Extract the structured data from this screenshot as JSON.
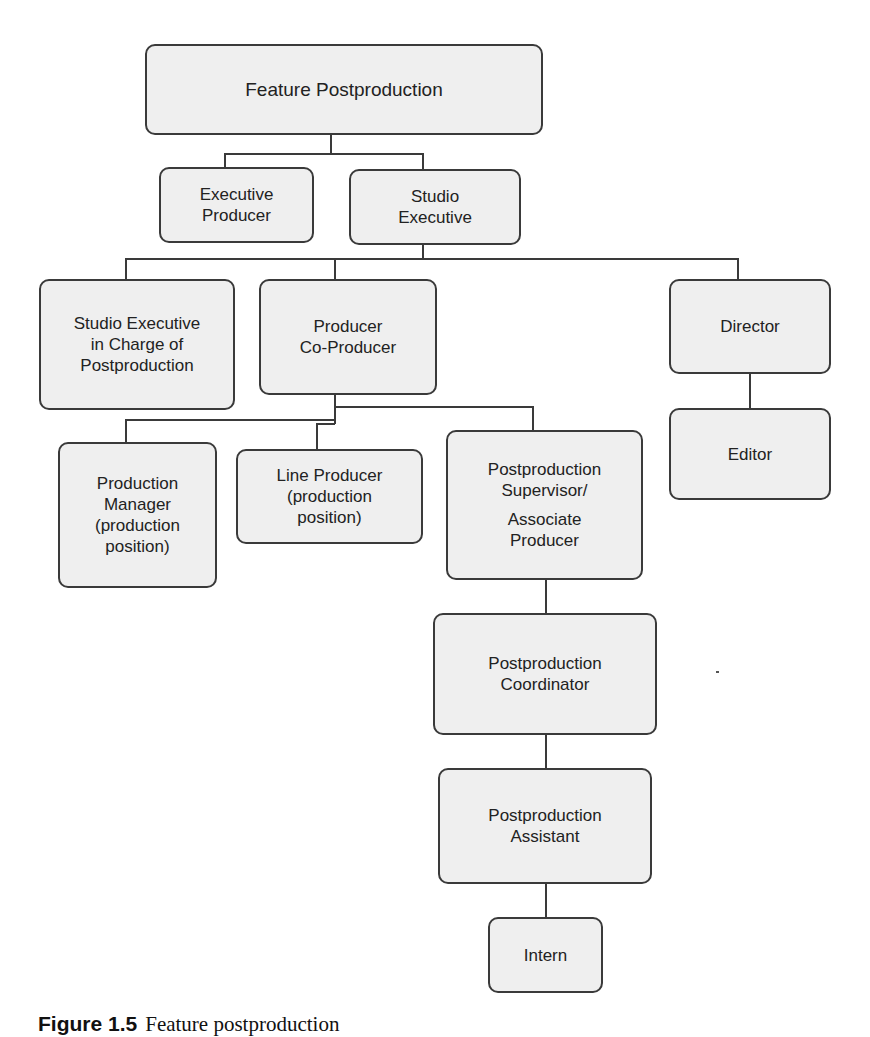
{
  "diagram": {
    "type": "org-chart",
    "title": "Feature Postproduction",
    "colors": {
      "box_fill": "#efefef",
      "box_border": "#3a3a3a",
      "connector": "#3a3a3a",
      "text": "#222222",
      "background": "#ffffff"
    },
    "nodes": {
      "root": {
        "lines": [
          "Feature Postproduction"
        ]
      },
      "executive_producer": {
        "lines": [
          "Executive",
          "Producer"
        ]
      },
      "studio_executive": {
        "lines": [
          "Studio",
          "Executive"
        ]
      },
      "studio_exec_post": {
        "lines": [
          "Studio Executive",
          "in Charge of",
          "Postproduction"
        ]
      },
      "producer": {
        "lines": [
          "Producer",
          "Co-Producer"
        ]
      },
      "director": {
        "lines": [
          "Director"
        ]
      },
      "editor": {
        "lines": [
          "Editor"
        ]
      },
      "production_manager": {
        "lines": [
          "Production",
          "Manager",
          "(production",
          "position)"
        ]
      },
      "line_producer": {
        "lines": [
          "Line Producer",
          "(production",
          "position)"
        ]
      },
      "post_supervisor": {
        "lines": [
          "Postproduction",
          "Supervisor/",
          "Associate",
          "Producer"
        ]
      },
      "post_coordinator": {
        "lines": [
          "Postproduction",
          "Coordinator"
        ]
      },
      "post_assistant": {
        "lines": [
          "Postproduction",
          "Assistant"
        ]
      },
      "intern": {
        "lines": [
          "Intern"
        ]
      }
    },
    "edges": [
      [
        "root",
        "executive_producer"
      ],
      [
        "root",
        "studio_executive"
      ],
      [
        "studio_executive",
        "studio_exec_post"
      ],
      [
        "studio_executive",
        "producer"
      ],
      [
        "studio_executive",
        "director"
      ],
      [
        "director",
        "editor"
      ],
      [
        "producer",
        "production_manager"
      ],
      [
        "producer",
        "line_producer"
      ],
      [
        "producer",
        "post_supervisor"
      ],
      [
        "post_supervisor",
        "post_coordinator"
      ],
      [
        "post_coordinator",
        "post_assistant"
      ],
      [
        "post_assistant",
        "intern"
      ]
    ]
  },
  "caption": {
    "label": "Figure 1.5",
    "text": "Feature postproduction"
  }
}
